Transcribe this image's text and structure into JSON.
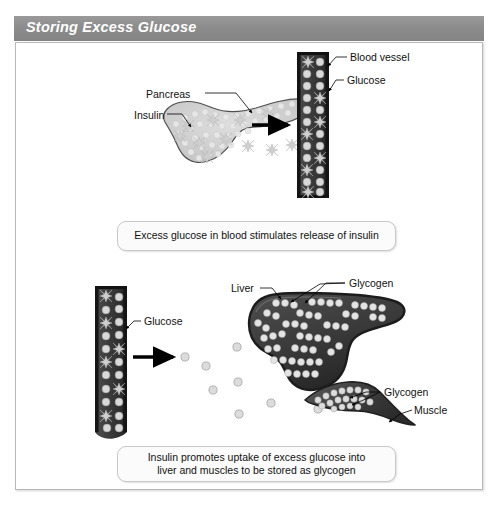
{
  "figure": {
    "title": "Storing Excess Glucose",
    "background_color": "#ffffff",
    "title_bar_color": "#8c8c8c",
    "title_text_color": "#ffffff",
    "frame_border_color": "#b9b9b9"
  },
  "colors": {
    "vessel_dark": "#3a3a3a",
    "vessel_edge": "#1d1d1d",
    "glucose_fill": "#d9d9d9",
    "glucose_stroke": "#8a8a8a",
    "insulin_star": "#cfcfcf",
    "pancreas_fill": "#d2d2d2",
    "pancreas_stroke": "#4a4a4a",
    "liver_fill": "#3d3d3d",
    "liver_stroke": "#1f1f1f",
    "glycogen_fill": "#e2e2e2",
    "muscle_fill": "#4a4a4a",
    "arrow_color": "#000000",
    "leader_line_color": "#000000"
  },
  "panel_top": {
    "labels": [
      {
        "name": "pancreas",
        "text": "Pancreas"
      },
      {
        "name": "insulin",
        "text": "Insulin"
      },
      {
        "name": "blood-vessel",
        "text": "Blood vessel"
      },
      {
        "name": "glucose",
        "text": "Glucose"
      }
    ],
    "caption": "Excess glucose in blood stimulates release of insulin"
  },
  "panel_bottom": {
    "labels": [
      {
        "name": "glucose",
        "text": "Glucose"
      },
      {
        "name": "liver",
        "text": "Liver"
      },
      {
        "name": "glycogen-liver",
        "text": "Glycogen"
      },
      {
        "name": "glycogen-muscle",
        "text": "Glycogen"
      },
      {
        "name": "muscle",
        "text": "Muscle"
      }
    ],
    "caption_line1": "Insulin promotes uptake of excess glucose into",
    "caption_line2": "liver and muscles to be stored as glycogen"
  },
  "diagram_data": {
    "type": "biological-process-diagram",
    "subject": "Glucose storage regulation by insulin",
    "steps": [
      {
        "step": 1,
        "description": "Excess glucose in blood stimulates release of insulin",
        "source_organ": "Pancreas",
        "secreted_molecule": "Insulin",
        "target": "Blood vessel"
      },
      {
        "step": 2,
        "description": "Insulin promotes uptake of excess glucose into liver and muscles to be stored as glycogen",
        "source": "Blood vessel",
        "transported_molecule": "Glucose",
        "storage_organs": [
          "Liver",
          "Muscle"
        ],
        "storage_form": "Glycogen"
      }
    ],
    "molecules": [
      {
        "name": "Glucose",
        "glyph": "circle",
        "color": "#d9d9d9"
      },
      {
        "name": "Insulin",
        "glyph": "star",
        "color": "#cfcfcf"
      },
      {
        "name": "Glycogen",
        "glyph": "circle-chain",
        "color": "#e2e2e2"
      }
    ]
  }
}
